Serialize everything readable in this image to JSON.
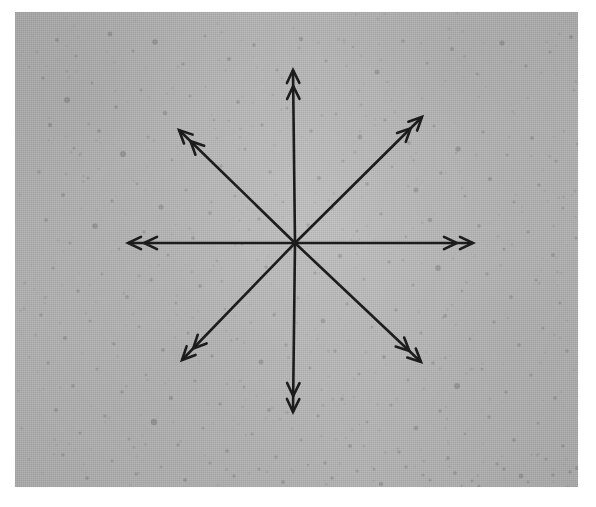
{
  "figure": {
    "caption": "",
    "kind": "annotated-image"
  },
  "canvas": {
    "width": 596,
    "height": 507,
    "page_background": "#ffffff"
  },
  "plate": {
    "name": "grainy gray photographic plate",
    "x": 15,
    "y": 12,
    "width": 563,
    "height": 475,
    "base_color": "#b9b9b9",
    "speckle_color": "#8f8f8f",
    "texture": "fine film grain with scattered darker speckles"
  },
  "overlay": {
    "center_x": 295,
    "center_y": 243,
    "arrow_color": "#1c1c1c",
    "arrow_line_width": 2.6,
    "head_style": "double-chevron",
    "arrow_count": 8,
    "arrows": [
      {
        "label": "north",
        "direction": "up",
        "angle_deg": 90,
        "tip_x": 293,
        "tip_y": 70,
        "length": 173
      },
      {
        "label": "northeast",
        "direction": "up-right",
        "angle_deg": 45,
        "tip_x": 422,
        "tip_y": 117,
        "length": 178
      },
      {
        "label": "east",
        "direction": "right",
        "angle_deg": 0,
        "tip_x": 473,
        "tip_y": 243,
        "length": 178
      },
      {
        "label": "southeast",
        "direction": "down-right",
        "angle_deg": -45,
        "tip_x": 421,
        "tip_y": 362,
        "length": 170
      },
      {
        "label": "south",
        "direction": "down",
        "angle_deg": -90,
        "tip_x": 293,
        "tip_y": 412,
        "length": 169
      },
      {
        "label": "southwest",
        "direction": "down-left",
        "angle_deg": -135,
        "tip_x": 182,
        "tip_y": 360,
        "length": 170
      },
      {
        "label": "west",
        "direction": "left",
        "angle_deg": 180,
        "tip_x": 128,
        "tip_y": 243,
        "length": 167
      },
      {
        "label": "northwest",
        "direction": "up-left",
        "angle_deg": 135,
        "tip_x": 179,
        "tip_y": 130,
        "length": 167
      }
    ]
  },
  "speckles": [
    [
      42,
      28,
      2.0
    ],
    [
      61,
      44,
      1.6
    ],
    [
      95,
      22,
      2.4
    ],
    [
      118,
      39,
      1.5
    ],
    [
      140,
      30,
      2.8
    ],
    [
      168,
      52,
      1.7
    ],
    [
      190,
      24,
      1.4
    ],
    [
      214,
      47,
      2.1
    ],
    [
      239,
      33,
      1.9
    ],
    [
      262,
      58,
      1.5
    ],
    [
      286,
      27,
      2.2
    ],
    [
      311,
      49,
      1.6
    ],
    [
      338,
      35,
      1.3
    ],
    [
      362,
      60,
      2.5
    ],
    [
      388,
      29,
      1.8
    ],
    [
      412,
      51,
      1.5
    ],
    [
      437,
      37,
      2.0
    ],
    [
      462,
      62,
      1.4
    ],
    [
      487,
      31,
      2.6
    ],
    [
      511,
      54,
      1.7
    ],
    [
      535,
      40,
      1.5
    ],
    [
      556,
      25,
      2.1
    ],
    [
      28,
      66,
      1.8
    ],
    [
      52,
      88,
      2.9
    ],
    [
      77,
      71,
      1.5
    ],
    [
      101,
      95,
      1.9
    ],
    [
      126,
      78,
      1.4
    ],
    [
      150,
      101,
      2.3
    ],
    [
      175,
      84,
      1.6
    ],
    [
      199,
      108,
      1.3
    ],
    [
      223,
      90,
      2.0
    ],
    [
      247,
      113,
      1.7
    ],
    [
      272,
      96,
      1.5
    ],
    [
      296,
      119,
      1.8
    ],
    [
      321,
      102,
      1.4
    ],
    [
      345,
      125,
      2.4
    ],
    [
      370,
      108,
      1.6
    ],
    [
      394,
      131,
      1.9
    ],
    [
      419,
      114,
      1.5
    ],
    [
      443,
      137,
      2.7
    ],
    [
      468,
      120,
      1.7
    ],
    [
      492,
      143,
      1.4
    ],
    [
      517,
      126,
      2.0
    ],
    [
      541,
      149,
      1.6
    ],
    [
      563,
      132,
      1.8
    ],
    [
      35,
      113,
      2.2
    ],
    [
      59,
      136,
      1.5
    ],
    [
      84,
      119,
      1.9
    ],
    [
      108,
      142,
      3.1
    ],
    [
      133,
      125,
      1.6
    ],
    [
      157,
      148,
      1.4
    ],
    [
      181,
      131,
      2.0
    ],
    [
      206,
      154,
      1.7
    ],
    [
      230,
      137,
      1.5
    ],
    [
      255,
      160,
      1.8
    ],
    [
      279,
      143,
      1.3
    ],
    [
      304,
      166,
      2.1
    ],
    [
      328,
      149,
      1.6
    ],
    [
      352,
      172,
      1.9
    ],
    [
      377,
      155,
      1.4
    ],
    [
      401,
      178,
      2.5
    ],
    [
      426,
      161,
      1.7
    ],
    [
      450,
      184,
      1.5
    ],
    [
      475,
      167,
      2.0
    ],
    [
      499,
      190,
      1.6
    ],
    [
      524,
      173,
      1.8
    ],
    [
      548,
      196,
      1.4
    ],
    [
      568,
      180,
      2.2
    ],
    [
      24,
      160,
      1.7
    ],
    [
      48,
      183,
      2.0
    ],
    [
      73,
      166,
      1.5
    ],
    [
      97,
      189,
      1.8
    ],
    [
      122,
      172,
      1.4
    ],
    [
      146,
      195,
      2.6
    ],
    [
      171,
      178,
      1.6
    ],
    [
      195,
      201,
      1.9
    ],
    [
      220,
      184,
      1.5
    ],
    [
      244,
      207,
      1.7
    ],
    [
      268,
      190,
      1.3
    ],
    [
      293,
      213,
      1.8
    ],
    [
      317,
      196,
      2.1
    ],
    [
      342,
      219,
      1.5
    ],
    [
      366,
      202,
      1.7
    ],
    [
      391,
      225,
      1.4
    ],
    [
      415,
      208,
      2.3
    ],
    [
      440,
      231,
      1.6
    ],
    [
      464,
      214,
      1.9
    ],
    [
      489,
      237,
      1.5
    ],
    [
      513,
      220,
      1.7
    ],
    [
      538,
      243,
      2.0
    ],
    [
      561,
      226,
      1.5
    ],
    [
      31,
      208,
      1.9
    ],
    [
      55,
      231,
      1.6
    ],
    [
      80,
      214,
      2.8
    ],
    [
      104,
      237,
      1.4
    ],
    [
      129,
      220,
      1.7
    ],
    [
      153,
      243,
      1.5
    ],
    [
      178,
      226,
      1.9
    ],
    [
      202,
      249,
      1.3
    ],
    [
      227,
      232,
      1.6
    ],
    [
      251,
      255,
      1.8
    ],
    [
      276,
      238,
      1.4
    ],
    [
      300,
      261,
      1.7
    ],
    [
      325,
      244,
      2.2
    ],
    [
      349,
      267,
      1.5
    ],
    [
      374,
      250,
      1.8
    ],
    [
      398,
      273,
      1.6
    ],
    [
      423,
      256,
      2.9
    ],
    [
      447,
      279,
      1.4
    ],
    [
      472,
      262,
      1.7
    ],
    [
      496,
      285,
      1.9
    ],
    [
      521,
      268,
      1.5
    ],
    [
      545,
      291,
      1.6
    ],
    [
      566,
      274,
      2.1
    ],
    [
      38,
      256,
      1.6
    ],
    [
      63,
      279,
      1.8
    ],
    [
      87,
      262,
      1.4
    ],
    [
      112,
      285,
      2.0
    ],
    [
      136,
      268,
      1.7
    ],
    [
      161,
      291,
      1.5
    ],
    [
      185,
      274,
      1.9
    ],
    [
      210,
      297,
      1.3
    ],
    [
      234,
      280,
      1.6
    ],
    [
      259,
      303,
      1.8
    ],
    [
      283,
      286,
      1.4
    ],
    [
      308,
      309,
      2.4
    ],
    [
      332,
      292,
      1.7
    ],
    [
      357,
      315,
      1.5
    ],
    [
      381,
      298,
      1.8
    ],
    [
      406,
      321,
      1.6
    ],
    [
      430,
      304,
      2.0
    ],
    [
      455,
      327,
      1.4
    ],
    [
      479,
      310,
      1.7
    ],
    [
      504,
      333,
      1.9
    ],
    [
      528,
      316,
      1.5
    ],
    [
      552,
      339,
      1.8
    ],
    [
      572,
      322,
      1.6
    ],
    [
      26,
      303,
      1.8
    ],
    [
      50,
      326,
      2.1
    ],
    [
      75,
      309,
      1.5
    ],
    [
      99,
      332,
      1.7
    ],
    [
      124,
      315,
      1.4
    ],
    [
      148,
      338,
      1.9
    ],
    [
      173,
      321,
      1.6
    ],
    [
      197,
      344,
      1.8
    ],
    [
      222,
      327,
      1.3
    ],
    [
      246,
      350,
      2.5
    ],
    [
      271,
      333,
      1.7
    ],
    [
      295,
      356,
      1.5
    ],
    [
      320,
      339,
      1.8
    ],
    [
      344,
      362,
      1.6
    ],
    [
      369,
      345,
      2.0
    ],
    [
      393,
      368,
      1.4
    ],
    [
      418,
      351,
      1.7
    ],
    [
      442,
      374,
      3.0
    ],
    [
      467,
      357,
      1.5
    ],
    [
      491,
      380,
      1.8
    ],
    [
      516,
      363,
      1.6
    ],
    [
      540,
      386,
      1.9
    ],
    [
      564,
      369,
      1.4
    ],
    [
      33,
      351,
      1.7
    ],
    [
      58,
      374,
      1.9
    ],
    [
      82,
      357,
      1.5
    ],
    [
      107,
      380,
      1.8
    ],
    [
      131,
      363,
      1.4
    ],
    [
      156,
      386,
      2.2
    ],
    [
      180,
      369,
      1.6
    ],
    [
      205,
      392,
      1.7
    ],
    [
      229,
      375,
      1.5
    ],
    [
      254,
      398,
      1.9
    ],
    [
      278,
      381,
      1.3
    ],
    [
      303,
      404,
      1.7
    ],
    [
      327,
      387,
      1.8
    ],
    [
      352,
      410,
      1.5
    ],
    [
      376,
      393,
      1.6
    ],
    [
      401,
      416,
      2.3
    ],
    [
      425,
      399,
      1.8
    ],
    [
      450,
      422,
      1.4
    ],
    [
      474,
      405,
      1.7
    ],
    [
      499,
      428,
      1.9
    ],
    [
      523,
      411,
      1.5
    ],
    [
      548,
      434,
      1.8
    ],
    [
      569,
      417,
      1.6
    ],
    [
      41,
      398,
      2.0
    ],
    [
      65,
      421,
      1.6
    ],
    [
      90,
      404,
      1.8
    ],
    [
      114,
      427,
      1.4
    ],
    [
      139,
      410,
      3.2
    ],
    [
      163,
      433,
      1.7
    ],
    [
      188,
      416,
      1.5
    ],
    [
      212,
      439,
      1.9
    ],
    [
      237,
      422,
      1.6
    ],
    [
      261,
      445,
      1.8
    ],
    [
      286,
      428,
      1.4
    ],
    [
      310,
      451,
      1.7
    ],
    [
      335,
      434,
      2.1
    ],
    [
      359,
      457,
      1.5
    ],
    [
      384,
      440,
      1.8
    ],
    [
      408,
      463,
      1.6
    ],
    [
      433,
      446,
      1.9
    ],
    [
      457,
      469,
      1.4
    ],
    [
      482,
      452,
      1.7
    ],
    [
      506,
      464,
      2.4
    ],
    [
      531,
      447,
      1.6
    ],
    [
      555,
      460,
      1.8
    ],
    [
      573,
      441,
      1.5
    ],
    [
      48,
      443,
      1.7
    ],
    [
      72,
      466,
      1.9
    ],
    [
      97,
      449,
      1.5
    ],
    [
      121,
      462,
      1.8
    ],
    [
      146,
      455,
      1.4
    ],
    [
      170,
      468,
      2.0
    ],
    [
      195,
      451,
      1.6
    ],
    [
      219,
      464,
      1.7
    ],
    [
      244,
      457,
      1.5
    ],
    [
      268,
      470,
      1.9
    ],
    [
      293,
      453,
      1.3
    ],
    [
      317,
      466,
      1.8
    ],
    [
      342,
      459,
      1.6
    ],
    [
      366,
      472,
      2.2
    ],
    [
      391,
      455,
      1.7
    ],
    [
      415,
      468,
      1.5
    ],
    [
      440,
      461,
      1.9
    ],
    [
      464,
      474,
      1.6
    ],
    [
      489,
      457,
      1.8
    ],
    [
      513,
      470,
      1.4
    ],
    [
      538,
      463,
      1.7
    ],
    [
      562,
      456,
      2.0
    ]
  ]
}
